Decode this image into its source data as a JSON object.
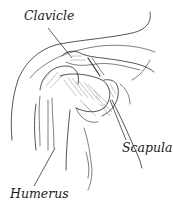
{
  "diagram": {
    "labels": {
      "clavicle": "Clavicle",
      "scapula": "Scapula",
      "humerus": "Humerus"
    },
    "colors": {
      "line": "#2a2a2a",
      "shade": "#8a8a8a",
      "background": "#ffffff"
    }
  }
}
